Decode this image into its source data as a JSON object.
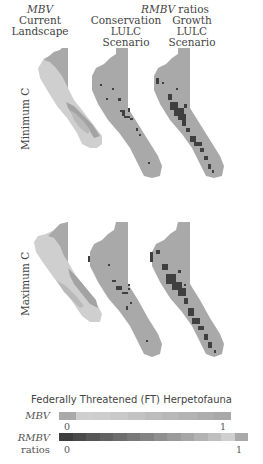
{
  "header": {
    "col1_metric": "MBV",
    "col1_line1": "Current",
    "col1_line2": "Landscape",
    "ratios_metric": "RMBV",
    "ratios_suffix": " ratios",
    "col2_line1": "Conservation",
    "col2_line2": "LULC Scenario",
    "col3_line1": "Growth",
    "col3_line2": "LULC Scenario"
  },
  "rows": [
    {
      "label": "Minimum C"
    },
    {
      "label": "Maximum C"
    }
  ],
  "legend": {
    "title": "Federally Threatened (FT) Herpetofauna",
    "mbv": {
      "label": "MBV",
      "min": "0",
      "max": "1",
      "colors": [
        "#a9a9a9",
        "#cfcfcf",
        "#cdcdcd",
        "#c8c8c8",
        "#c3c3c3",
        "#bdbdbd",
        "#b8b8b8",
        "#b3b3b3",
        "#aeaeae",
        "#a8a8a8"
      ]
    },
    "rmbv": {
      "label_line1": "RMBV",
      "label_line2": "ratios",
      "min": "0",
      "max": "1",
      "colors": [
        "#3e3e3e",
        "#4a4a4a",
        "#565656",
        "#626262",
        "#6d6d6d",
        "#787878",
        "#838383",
        "#8f8f8f",
        "#9a9a9a",
        "#a6a6a6",
        "#b2b2b2",
        "#bfbfbf",
        "#cfcfcf",
        "#a9a9a9"
      ]
    }
  },
  "colors": {
    "map_base": "#a9a9a9",
    "map_light": "#cfcfcf",
    "map_dark": "#3f3f3f",
    "map_mid": "#9a9a9a"
  }
}
